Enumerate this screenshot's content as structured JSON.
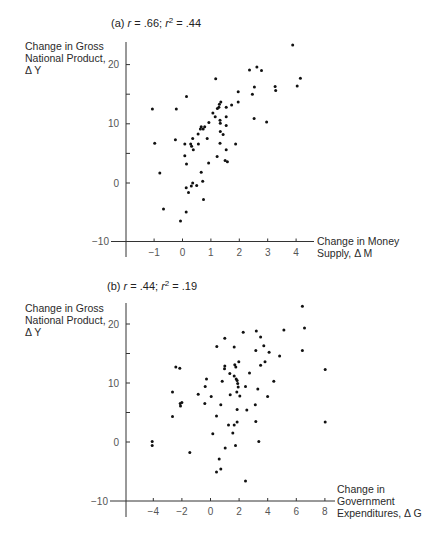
{
  "chart_data": [
    {
      "type": "scatter",
      "panel": "a",
      "title": "(a) r = .66; r² = .44",
      "title_parts": {
        "prefix": "(a) ",
        "r_label": "r",
        "r_value": " = .66; ",
        "r2_label": "r",
        "r2_sup": "2",
        "r2_value": " = .44"
      },
      "ylabel_lines": [
        "Change in Gross",
        "National Product,",
        "Δ Y"
      ],
      "xlabel_lines": [
        "Change in Money",
        "Supply, Δ M"
      ],
      "xlim": [
        -1.9,
        4.6
      ],
      "ylim": [
        -10,
        24
      ],
      "xticks": [
        -1,
        0,
        1,
        2,
        3,
        4
      ],
      "yticks": [
        20,
        15,
        10,
        5,
        0,
        -10
      ],
      "ytick_labels": {
        "20": "20",
        "10": "10",
        "0": "0",
        "-10": "−10"
      },
      "grid": false,
      "points": [
        [
          3.88,
          23.3
        ],
        [
          2.36,
          19.1
        ],
        [
          2.62,
          19.6
        ],
        [
          2.78,
          19.0
        ],
        [
          1.17,
          17.6
        ],
        [
          4.15,
          17.7
        ],
        [
          4.04,
          16.4
        ],
        [
          3.26,
          16.3
        ],
        [
          3.28,
          15.6
        ],
        [
          2.53,
          16.2
        ],
        [
          2.46,
          15.0
        ],
        [
          1.96,
          15.4
        ],
        [
          1.96,
          13.7
        ],
        [
          0.14,
          14.6
        ],
        [
          -1.06,
          12.5
        ],
        [
          -0.22,
          12.5
        ],
        [
          1.35,
          13.7
        ],
        [
          1.3,
          13.3
        ],
        [
          1.28,
          12.8
        ],
        [
          1.23,
          12.6
        ],
        [
          1.54,
          12.8
        ],
        [
          1.73,
          13.2
        ],
        [
          1.07,
          11.8
        ],
        [
          1.15,
          11.2
        ],
        [
          1.54,
          11.2
        ],
        [
          1.32,
          10.6
        ],
        [
          1.33,
          10.1
        ],
        [
          0.93,
          10.2
        ],
        [
          1.54,
          9.7
        ],
        [
          0.66,
          9.5
        ],
        [
          0.78,
          9.5
        ],
        [
          0.63,
          9.1
        ],
        [
          0.73,
          9.1
        ],
        [
          0.55,
          8.3
        ],
        [
          1.33,
          8.7
        ],
        [
          1.43,
          8.2
        ],
        [
          2.52,
          10.9
        ],
        [
          2.96,
          10.3
        ],
        [
          0.36,
          7.5
        ],
        [
          -0.25,
          7.3
        ],
        [
          0.87,
          7.5
        ],
        [
          -0.98,
          6.7
        ],
        [
          0.08,
          6.6
        ],
        [
          0.29,
          6.6
        ],
        [
          0.32,
          6.2
        ],
        [
          0.56,
          6.6
        ],
        [
          1.32,
          6.7
        ],
        [
          1.87,
          6.6
        ],
        [
          0.38,
          5.6
        ],
        [
          1.54,
          5.6
        ],
        [
          0.08,
          4.6
        ],
        [
          1.22,
          4.5
        ],
        [
          0.14,
          3.2
        ],
        [
          0.92,
          3.4
        ],
        [
          1.5,
          3.8
        ],
        [
          1.58,
          3.6
        ],
        [
          -0.8,
          1.7
        ],
        [
          0.66,
          1.8
        ],
        [
          0.71,
          0.3
        ],
        [
          0.36,
          0.0
        ],
        [
          0.31,
          -0.5
        ],
        [
          0.5,
          -0.4
        ],
        [
          0.13,
          -0.8
        ],
        [
          0.21,
          -1.6
        ],
        [
          0.74,
          -2.8
        ],
        [
          -0.67,
          -4.4
        ],
        [
          0.13,
          -4.9
        ],
        [
          -0.07,
          -6.4
        ]
      ]
    },
    {
      "type": "scatter",
      "panel": "b",
      "title": "(b) r = .44; r² = .19",
      "title_parts": {
        "prefix": "(b) ",
        "r_label": "r",
        "r_value": " = .44; ",
        "r2_label": "r",
        "r2_sup": "2",
        "r2_value": " = .19"
      },
      "ylabel_lines": [
        "Change in Gross",
        "National Product,",
        "Δ Y"
      ],
      "xlabel_lines": [
        "Change in",
        "Government",
        "Expenditures, Δ G"
      ],
      "xlim": [
        -7,
        8.8
      ],
      "ylim": [
        -10,
        24
      ],
      "xticks": [
        -4,
        -2,
        0,
        2,
        4,
        6,
        8
      ],
      "yticks": [
        20,
        15,
        10,
        5,
        0,
        -10
      ],
      "ytick_labels": {
        "20": "20",
        "10": "10",
        "0": "0",
        "-10": "−10"
      },
      "grid": false,
      "points": [
        [
          6.43,
          23.0
        ],
        [
          6.57,
          19.3
        ],
        [
          5.13,
          19.0
        ],
        [
          3.2,
          18.8
        ],
        [
          2.29,
          18.6
        ],
        [
          3.5,
          17.8
        ],
        [
          1.0,
          17.6
        ],
        [
          0.44,
          16.2
        ],
        [
          1.66,
          16.1
        ],
        [
          3.73,
          16.3
        ],
        [
          3.17,
          15.5
        ],
        [
          6.43,
          15.5
        ],
        [
          4.1,
          15.2
        ],
        [
          4.83,
          14.6
        ],
        [
          1.98,
          13.6
        ],
        [
          3.81,
          13.6
        ],
        [
          3.5,
          13.0
        ],
        [
          1.7,
          13.1
        ],
        [
          1.0,
          12.9
        ],
        [
          1.77,
          12.7
        ],
        [
          0.98,
          12.4
        ],
        [
          -2.43,
          12.7
        ],
        [
          -2.15,
          12.5
        ],
        [
          8.02,
          12.3
        ],
        [
          2.73,
          11.7
        ],
        [
          1.35,
          11.6
        ],
        [
          1.66,
          11.2
        ],
        [
          1.8,
          10.7
        ],
        [
          -0.28,
          10.7
        ],
        [
          0.82,
          10.3
        ],
        [
          1.86,
          10.4
        ],
        [
          4.43,
          10.3
        ],
        [
          1.9,
          9.9
        ],
        [
          -0.37,
          9.4
        ],
        [
          1.94,
          9.3
        ],
        [
          2.45,
          9.4
        ],
        [
          3.31,
          9.0
        ],
        [
          -2.66,
          8.5
        ],
        [
          1.84,
          8.5
        ],
        [
          -0.86,
          8.1
        ],
        [
          1.38,
          8.0
        ],
        [
          0.05,
          7.7
        ],
        [
          2.05,
          7.8
        ],
        [
          3.99,
          7.7
        ],
        [
          -2.0,
          6.7
        ],
        [
          -2.12,
          6.5
        ],
        [
          -2.1,
          6.1
        ],
        [
          -0.4,
          6.5
        ],
        [
          0.72,
          6.3
        ],
        [
          3.13,
          6.3
        ],
        [
          1.86,
          5.5
        ],
        [
          2.54,
          5.4
        ],
        [
          -2.66,
          4.3
        ],
        [
          0.42,
          4.4
        ],
        [
          3.17,
          3.5
        ],
        [
          1.86,
          3.4
        ],
        [
          8.02,
          3.4
        ],
        [
          1.26,
          2.9
        ],
        [
          1.66,
          2.9
        ],
        [
          1.56,
          1.5
        ],
        [
          0.16,
          1.4
        ],
        [
          -4.08,
          0.1
        ],
        [
          -4.08,
          -0.6
        ],
        [
          3.38,
          0.1
        ],
        [
          1.03,
          -1.0
        ],
        [
          1.75,
          -0.6
        ],
        [
          -1.45,
          -1.8
        ],
        [
          0.61,
          -2.9
        ],
        [
          0.42,
          -5.1
        ],
        [
          0.72,
          -4.6
        ],
        [
          2.45,
          -6.6
        ]
      ]
    }
  ]
}
